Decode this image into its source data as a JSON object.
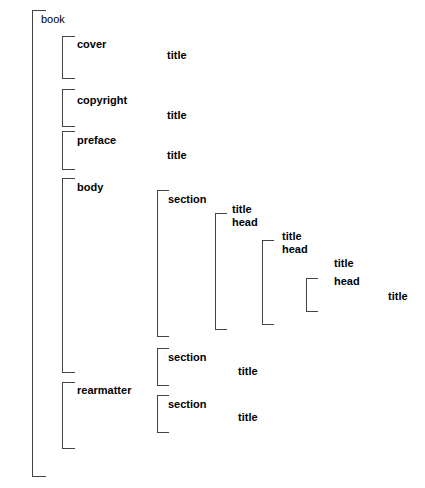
{
  "diagram": {
    "line_color": "#444444",
    "text_color": "#000000",
    "background": "#ffffff",
    "root": {
      "label": "book"
    },
    "nodes": {
      "cover": "cover",
      "cover_title": "title",
      "copyright": "copyright",
      "copyright_title": "title",
      "preface": "preface",
      "preface_title": "title",
      "body": "body",
      "section1": "section",
      "section1_title": "title",
      "section1_head": "head",
      "sub2_title": "title",
      "sub2_head": "head",
      "sub3_title": "title",
      "sub3_head": "head",
      "sub4_title": "title",
      "sub4_head": "head",
      "sub5_title": "title",
      "rearmatter": "rearmatter",
      "rear_section1": "section",
      "rear_section1_title": "title",
      "rear_section2": "section",
      "rear_section2_title": "title"
    }
  }
}
